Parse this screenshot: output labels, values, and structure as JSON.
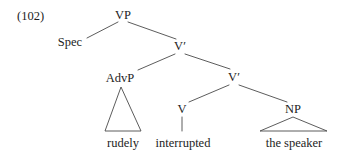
{
  "figure": {
    "example_number": "(102)",
    "example_number_x": 17,
    "example_number_y": 20,
    "sentence": "rudely interrupted the speaker"
  },
  "nodes": {
    "vp": {
      "label": "VP",
      "x": 123,
      "y": 19
    },
    "spec": {
      "label": "Spec",
      "x": 70,
      "y": 46
    },
    "vbar1": {
      "label": "V′",
      "x": 180,
      "y": 50
    },
    "advp": {
      "label": "AdvP",
      "x": 120,
      "y": 82
    },
    "vbar2": {
      "label": "V′",
      "x": 234,
      "y": 81
    },
    "v": {
      "label": "V",
      "x": 182,
      "y": 113
    },
    "np": {
      "label": "NP",
      "x": 293,
      "y": 113
    }
  },
  "terminals": {
    "rudely": {
      "label": "rudely",
      "x": 123,
      "y": 147
    },
    "interrupted": {
      "label": "interrupted",
      "x": 183,
      "y": 147
    },
    "the_speaker": {
      "label": "the speaker",
      "x": 294,
      "y": 147
    }
  },
  "branches": [
    {
      "name": "vp-to-spec",
      "x1": 118,
      "y1": 22,
      "x2": 87,
      "y2": 38
    },
    {
      "name": "vp-to-vbar1",
      "x1": 128,
      "y1": 22,
      "x2": 176,
      "y2": 39
    },
    {
      "name": "vbar1-to-advp",
      "x1": 175,
      "y1": 54,
      "x2": 138,
      "y2": 70
    },
    {
      "name": "vbar1-to-vbar2",
      "x1": 185,
      "y1": 54,
      "x2": 230,
      "y2": 69
    },
    {
      "name": "vbar2-to-v",
      "x1": 229,
      "y1": 85,
      "x2": 189,
      "y2": 102
    },
    {
      "name": "vbar2-to-np",
      "x1": 239,
      "y1": 85,
      "x2": 287,
      "y2": 102
    },
    {
      "name": "v-to-interrupted",
      "x1": 182,
      "y1": 117,
      "x2": 182,
      "y2": 131
    }
  ],
  "triangles": [
    {
      "name": "advp-triangle",
      "apex_x": 121,
      "apex_y": 87,
      "left_x": 105,
      "left_y": 131,
      "right_x": 141,
      "right_y": 131
    },
    {
      "name": "np-triangle",
      "apex_x": 293,
      "apex_y": 117,
      "left_x": 260,
      "left_y": 131,
      "right_x": 327,
      "right_y": 131
    }
  ],
  "colors": {
    "background": "#ffffff",
    "text": "#1d1d1d",
    "line": "#4a4a4a"
  }
}
